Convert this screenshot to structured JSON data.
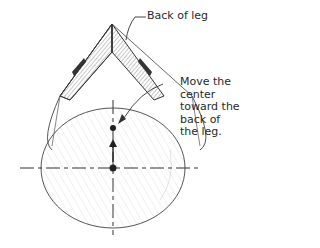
{
  "labels": {
    "back_of_leg": "Back of leg",
    "move_center": [
      "Move the",
      "center",
      "toward the",
      "back of",
      "the leg."
    ]
  },
  "colors": {
    "line": "#333333",
    "hatch": "#bbbbbb",
    "text": "#2a2a2a"
  }
}
